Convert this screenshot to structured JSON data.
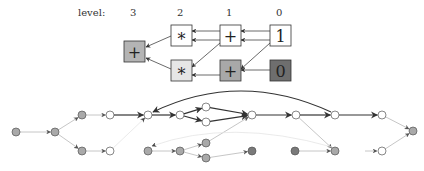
{
  "levels": {
    "label": "level:",
    "items": [
      {
        "text": "3",
        "x": 133
      },
      {
        "text": "2",
        "x": 180
      },
      {
        "text": "1",
        "x": 229
      },
      {
        "text": "0",
        "x": 279
      }
    ]
  },
  "colors": {
    "white": "#ffffff",
    "light_gray": "#e6e6e6",
    "mid_gray": "#a8a8a8",
    "gray_box": "#b4b4b4",
    "dark_gray": "#6e6e6e",
    "node_gray": "#a9a9a9",
    "node_dark": "#7a7a7a",
    "edge_dark": "#333333",
    "edge_light": "#b8b8b8",
    "edge_faint": "#e4e4e4"
  },
  "boxes": [
    {
      "id": "plus3",
      "symbol": "+",
      "level": 3,
      "x": 124,
      "y": 41,
      "fill": "gray_box"
    },
    {
      "id": "star2top",
      "symbol": "*",
      "level": 2,
      "x": 171,
      "y": 25,
      "fill": "white"
    },
    {
      "id": "star2bot",
      "symbol": "*",
      "level": 2,
      "x": 171,
      "y": 60,
      "fill": "light_gray"
    },
    {
      "id": "plus1top",
      "symbol": "+",
      "level": 1,
      "x": 220,
      "y": 25,
      "fill": "white"
    },
    {
      "id": "plus1bot",
      "symbol": "+",
      "level": 1,
      "x": 220,
      "y": 60,
      "fill": "mid_gray"
    },
    {
      "id": "one0",
      "symbol": "1",
      "level": 0,
      "x": 270,
      "y": 25,
      "fill": "white"
    },
    {
      "id": "zero0",
      "symbol": "0",
      "level": 0,
      "x": 270,
      "y": 60,
      "fill": "dark_gray"
    }
  ],
  "box_edges": [
    {
      "x1": 270,
      "y1": 31,
      "x2": 241,
      "y2": 31
    },
    {
      "x1": 270,
      "y1": 40,
      "x2": 241,
      "y2": 40
    },
    {
      "x1": 270,
      "y1": 43,
      "x2": 241,
      "y2": 69
    },
    {
      "x1": 270,
      "y1": 70,
      "x2": 241,
      "y2": 70
    },
    {
      "x1": 220,
      "y1": 31,
      "x2": 192,
      "y2": 31
    },
    {
      "x1": 220,
      "y1": 40,
      "x2": 192,
      "y2": 40
    },
    {
      "x1": 220,
      "y1": 43,
      "x2": 192,
      "y2": 67
    },
    {
      "x1": 220,
      "y1": 75,
      "x2": 192,
      "y2": 75
    },
    {
      "x1": 171,
      "y1": 36,
      "x2": 146,
      "y2": 47
    },
    {
      "x1": 171,
      "y1": 69,
      "x2": 146,
      "y2": 58
    }
  ],
  "graph": {
    "nodes": [
      {
        "id": "A",
        "x": 16,
        "y": 132,
        "fill": "node_gray"
      },
      {
        "id": "B",
        "x": 55,
        "y": 132,
        "fill": "node_gray"
      },
      {
        "id": "C",
        "x": 82,
        "y": 115,
        "fill": "node_gray"
      },
      {
        "id": "D",
        "x": 110,
        "y": 115,
        "fill": "white"
      },
      {
        "id": "E",
        "x": 82,
        "y": 151,
        "fill": "node_gray"
      },
      {
        "id": "F",
        "x": 110,
        "y": 151,
        "fill": "white"
      },
      {
        "id": "G",
        "x": 148,
        "y": 115,
        "fill": "white"
      },
      {
        "id": "H",
        "x": 180,
        "y": 115,
        "fill": "white"
      },
      {
        "id": "I",
        "x": 206,
        "y": 107,
        "fill": "white"
      },
      {
        "id": "J",
        "x": 206,
        "y": 122,
        "fill": "white"
      },
      {
        "id": "K",
        "x": 252,
        "y": 115,
        "fill": "white"
      },
      {
        "id": "L",
        "x": 296,
        "y": 115,
        "fill": "white"
      },
      {
        "id": "M",
        "x": 335,
        "y": 115,
        "fill": "white"
      },
      {
        "id": "N",
        "x": 382,
        "y": 115,
        "fill": "white"
      },
      {
        "id": "O",
        "x": 413,
        "y": 131,
        "fill": "node_gray"
      },
      {
        "id": "P",
        "x": 148,
        "y": 151,
        "fill": "node_gray"
      },
      {
        "id": "Q",
        "x": 180,
        "y": 151,
        "fill": "node_gray"
      },
      {
        "id": "R",
        "x": 206,
        "y": 143,
        "fill": "node_gray"
      },
      {
        "id": "S",
        "x": 206,
        "y": 158,
        "fill": "node_gray"
      },
      {
        "id": "T",
        "x": 252,
        "y": 151,
        "fill": "node_dark"
      },
      {
        "id": "U",
        "x": 295,
        "y": 151,
        "fill": "node_dark"
      },
      {
        "id": "V",
        "x": 335,
        "y": 151,
        "fill": "node_gray"
      },
      {
        "id": "W",
        "x": 382,
        "y": 151,
        "fill": "white"
      }
    ],
    "edges": [
      {
        "from": "A",
        "to": "B",
        "style": "light"
      },
      {
        "from": "B",
        "to": "C",
        "style": "light"
      },
      {
        "from": "B",
        "to": "E",
        "style": "light"
      },
      {
        "from": "C",
        "to": "D",
        "style": "light"
      },
      {
        "from": "E",
        "to": "F",
        "style": "light"
      },
      {
        "from": "D",
        "to": "G",
        "style": "dark"
      },
      {
        "from": "F",
        "to": "G",
        "style": "faint"
      },
      {
        "from": "G",
        "to": "H",
        "style": "dark"
      },
      {
        "from": "H",
        "to": "I",
        "style": "dark"
      },
      {
        "from": "H",
        "to": "J",
        "style": "dark"
      },
      {
        "from": "I",
        "to": "K",
        "style": "dark"
      },
      {
        "from": "J",
        "to": "K",
        "style": "dark"
      },
      {
        "from": "R",
        "to": "K",
        "style": "light"
      },
      {
        "from": "K",
        "to": "L",
        "style": "dark"
      },
      {
        "from": "L",
        "to": "M",
        "style": "dark"
      },
      {
        "from": "L",
        "to": "V",
        "style": "light"
      },
      {
        "from": "M",
        "to": "N",
        "style": "dark"
      },
      {
        "from": "N",
        "to": "O",
        "style": "light"
      },
      {
        "from": "W",
        "to": "O",
        "style": "light"
      },
      {
        "from": "P",
        "to": "Q",
        "style": "light"
      },
      {
        "from": "Q",
        "to": "R",
        "style": "light"
      },
      {
        "from": "Q",
        "to": "S",
        "style": "light"
      },
      {
        "from": "S",
        "to": "T",
        "style": "light"
      },
      {
        "from": "U",
        "to": "V",
        "style": "light"
      }
    ],
    "curved_edges": [
      {
        "from": "M",
        "to": "G",
        "style": "dark",
        "path": "M 331 112 Q 240 70 153 112"
      },
      {
        "from": "V",
        "to": "P",
        "style": "faint",
        "path": "M 332 147 Q 230 118 152 146"
      }
    ],
    "stub_edges": [
      {
        "x1": 365,
        "y1": 151,
        "x2": 377,
        "y2": 151,
        "style": "light"
      }
    ]
  }
}
